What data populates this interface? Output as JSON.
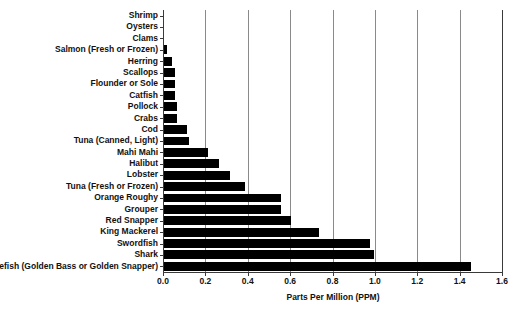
{
  "chart_data": {
    "type": "bar",
    "orientation": "horizontal",
    "title": "",
    "xlabel": "Parts Per Million (PPM)",
    "ylabel": "",
    "xlim": [
      0.0,
      1.6
    ],
    "xticks": [
      "0.0",
      "0.2",
      "0.4",
      "0.6",
      "0.8",
      "1.0",
      "1.2",
      "1.4",
      "1.6"
    ],
    "xtick_values": [
      0.0,
      0.2,
      0.4,
      0.6,
      0.8,
      1.0,
      1.2,
      1.4,
      1.6
    ],
    "grid": true,
    "grid_axis": "x",
    "legend": false,
    "bar_color": "#000000",
    "categories": [
      "Shrimp",
      "Oysters",
      "Clams",
      "Salmon (Fresh or Frozen)",
      "Herring",
      "Scallops",
      "Flounder or Sole",
      "Catfish",
      "Pollock",
      "Crabs",
      "Cod",
      "Tuna (Canned, Light)",
      "Mahi Mahi",
      "Halibut",
      "Lobster",
      "Tuna (Fresh or Frozen)",
      "Orange Roughy",
      "Grouper",
      "Red Snapper",
      "King Mackerel",
      "Swordfish",
      "Shark",
      "Tilefish (Golden Bass or Golden Snapper)"
    ],
    "values": [
      0.0,
      0.0,
      0.0,
      0.014,
      0.04,
      0.05,
      0.05,
      0.05,
      0.06,
      0.06,
      0.11,
      0.12,
      0.21,
      0.26,
      0.31,
      0.38,
      0.55,
      0.55,
      0.6,
      0.73,
      0.97,
      0.99,
      1.45
    ]
  }
}
